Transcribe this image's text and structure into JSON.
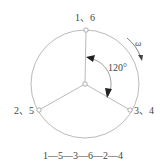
{
  "diagram": {
    "type": "engine-crank-firing-diagram",
    "labels": {
      "top": "1、6",
      "left": "2、5",
      "right": "3、4",
      "angle": "120°",
      "rotation": "ω"
    },
    "firing_order": "1—5—3—6—2—4",
    "geometry": {
      "center": [
        85,
        84
      ],
      "radius": 54,
      "nodes": {
        "top": [
          86,
          30
        ],
        "left": [
          39,
          110
        ],
        "right": [
          130,
          110
        ]
      }
    },
    "colors": {
      "line": "#a0a0a0",
      "arrow": "#222222",
      "text": "#444444"
    }
  }
}
